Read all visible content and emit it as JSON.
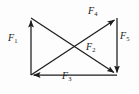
{
  "figure": {
    "type": "force-vector-diagram",
    "stroke_color": "#1c1c1c",
    "background_color": "#fdfdfd",
    "width": 139,
    "height": 94
  },
  "geometry": {
    "top_left": [
      31,
      18
    ],
    "top_right": [
      117,
      18
    ],
    "bottom_left": [
      31,
      75
    ],
    "bottom_right": [
      117,
      75
    ]
  },
  "vectors": [
    {
      "id": "F1",
      "label": "F",
      "subscript": "1",
      "from": "bottom-left",
      "to": "top-left",
      "direction": "up",
      "arrowhead_at": "top-left"
    },
    {
      "id": "F4",
      "label": "F",
      "subscript": "4",
      "from": "bottom-left",
      "to": "top-right",
      "direction": "up-right",
      "arrowhead_at": "top-right"
    },
    {
      "id": "F5",
      "label": "F",
      "subscript": "5",
      "from": "top-right",
      "to": "bottom-right",
      "direction": "down",
      "arrowhead_at": "bottom-right"
    },
    {
      "id": "F2",
      "label": "F",
      "subscript": "2",
      "from": "top-left",
      "to": "bottom-right",
      "direction": "down-right",
      "arrowhead_at": "bottom-right"
    },
    {
      "id": "F3",
      "label": "F",
      "subscript": "3",
      "from": "bottom-right",
      "to": "bottom-left",
      "direction": "left",
      "arrowhead_at": "bottom-left"
    }
  ],
  "labels": {
    "f1": {
      "text": "F",
      "sub": "1"
    },
    "f2": {
      "text": "F",
      "sub": "2"
    },
    "f3": {
      "text": "F",
      "sub": "3"
    },
    "f4": {
      "text": "F",
      "sub": "4"
    },
    "f5": {
      "text": "F",
      "sub": "5"
    }
  }
}
